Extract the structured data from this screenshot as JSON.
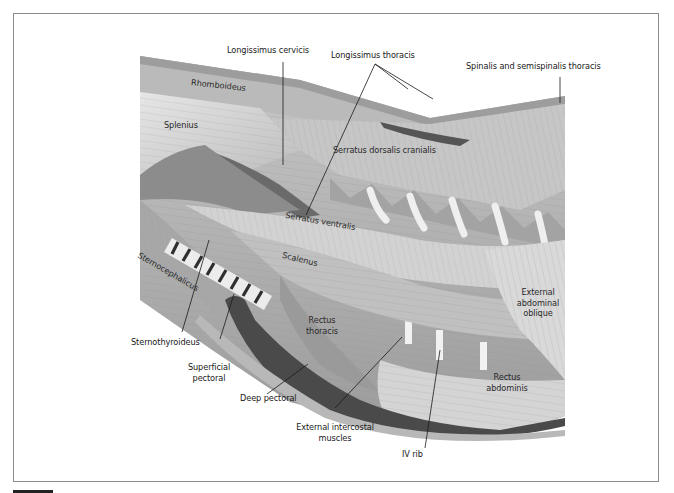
{
  "figure": {
    "type": "anatomical-illustration",
    "colors": {
      "frame_border": "#8c8c8c",
      "muscle_light": "#d8d8d8",
      "muscle_mid": "#a9a9a9",
      "muscle_dark": "#6e6e6e",
      "leader_line": "#1a1a1a",
      "text": "#1a1a1a"
    }
  },
  "labels": {
    "longissimus_cervicis": "Longissimus cervicis",
    "longissimus_thoracis": "Longissimus thoracis",
    "spinalis_semispinalis": "Spinalis and semispinalis thoracis",
    "rhomboideus": "Rhomboideus",
    "splenius": "Splenius",
    "serratus_dorsalis": "Serratus dorsalis cranialis",
    "serratus_ventralis": "Serratus ventralis",
    "scalenus": "Scalenus",
    "sternocephalicus": "Sternocephalicus",
    "rectus_thoracis_1": "Rectus",
    "rectus_thoracis_2": "thoracis",
    "external_abdominal_1": "External",
    "external_abdominal_2": "abdominal",
    "external_abdominal_3": "oblique",
    "rectus_abdominis_1": "Rectus",
    "rectus_abdominis_2": "abdominis",
    "sternothyroideus": "Sternothyroideus",
    "superficial_pectoral_1": "Superficial",
    "superficial_pectoral_2": "pectoral",
    "deep_pectoral": "Deep pectoral",
    "external_intercostal_1": "External intercostal",
    "external_intercostal_2": "muscles",
    "iv_rib": "IV rib"
  }
}
